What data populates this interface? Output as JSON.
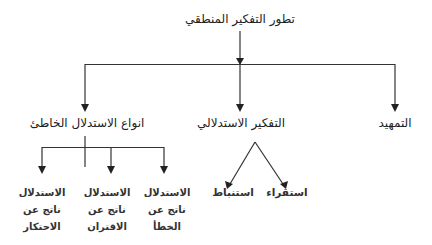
{
  "diagram": {
    "title": "تطور التفكير المنطقي",
    "level1": [
      {
        "id": "intro",
        "label": "التمهيد"
      },
      {
        "id": "deductive",
        "label": "التفكير الاستدلالي"
      },
      {
        "id": "fallacies",
        "label": "انواع الاستدلال الخاطئ"
      }
    ],
    "deductive_children": [
      {
        "id": "induction",
        "label": "استقراء"
      },
      {
        "id": "deduction",
        "label": "استنباط"
      }
    ],
    "fallacy_children": [
      {
        "id": "error",
        "lines": [
          "الاستدلال",
          "ناتج عن",
          "الخطأ"
        ]
      },
      {
        "id": "association",
        "lines": [
          "الاستدلال",
          "ناتج عن",
          "الاقتران"
        ]
      },
      {
        "id": "monopoly",
        "lines": [
          "الاستدلال",
          "ناتج عن",
          "الاحتكار"
        ]
      }
    ],
    "colors": {
      "line": "#333333",
      "text": "#222222",
      "background": "#ffffff"
    }
  }
}
